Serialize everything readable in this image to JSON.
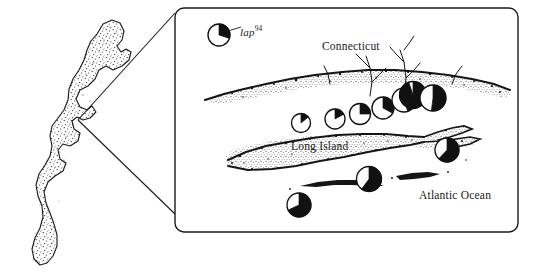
{
  "figure": {
    "background": "#ffffff",
    "ink": "#111111"
  },
  "legend": {
    "symbol_name": "pie-symbol",
    "label_text": "lap",
    "label_superscript": "94",
    "pie_fraction": 0.3,
    "cx": 219,
    "cy": 35,
    "r": 11
  },
  "labels": {
    "connecticut": "Connecticut",
    "long_island": "Long Island",
    "atlantic_ocean": "Atlantic Ocean"
  },
  "detail_box": {
    "x": 175,
    "y": 8,
    "width": 343,
    "height": 224,
    "radius": 9,
    "stroke": "#1a1a1a",
    "stroke_width": 1.4
  },
  "callout": {
    "apex_x": 78,
    "apex_y": 120,
    "upper_to_x": 175,
    "upper_to_y": 13,
    "lower_to_x": 175,
    "lower_to_y": 214,
    "stroke": "#1a1a1a",
    "stroke_width": 1.1
  },
  "chart_data": {
    "type": "pie",
    "legend_label": "lap 94",
    "value_label": "fraction black",
    "filled_color": "#111111",
    "empty_color": "#ffffff",
    "sites": [
      {
        "name": "site-1",
        "cx": 301,
        "cy": 123,
        "r": 9.5,
        "fraction": 0.14
      },
      {
        "name": "site-2",
        "cx": 335,
        "cy": 119,
        "r": 10.0,
        "fraction": 0.17
      },
      {
        "name": "site-3",
        "cx": 360,
        "cy": 114,
        "r": 10.5,
        "fraction": 0.25
      },
      {
        "name": "site-4",
        "cx": 383,
        "cy": 108,
        "r": 11.0,
        "fraction": 0.33
      },
      {
        "name": "site-5",
        "cx": 404,
        "cy": 100,
        "r": 12.0,
        "fraction": 0.45
      },
      {
        "name": "site-6",
        "cx": 413,
        "cy": 95,
        "r": 13.5,
        "fraction": 0.95
      },
      {
        "name": "site-7",
        "cx": 433,
        "cy": 98,
        "r": 13.0,
        "fraction": 0.52
      },
      {
        "name": "site-8",
        "cx": 447,
        "cy": 150,
        "r": 12.0,
        "fraction": 0.62
      },
      {
        "name": "site-9",
        "cx": 369,
        "cy": 179,
        "r": 12.5,
        "fraction": 0.6
      },
      {
        "name": "site-10",
        "cx": 299,
        "cy": 205,
        "r": 12.0,
        "fraction": 0.68
      }
    ]
  },
  "inset_map": {
    "name": "east-coast-outline",
    "style": "stippled coastline silhouette"
  },
  "detail_map": {
    "name": "long-island-sound-detail",
    "style": "stippled coastline with river inlets"
  }
}
